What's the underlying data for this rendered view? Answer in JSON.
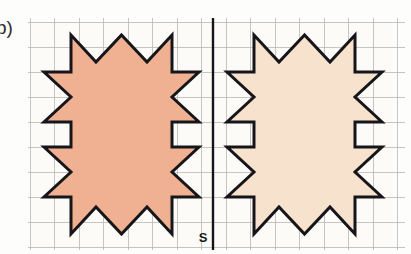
{
  "figure": {
    "exercise_label": "b)",
    "caption_axis_label": "S",
    "colors": {
      "background": "#fdfdfc",
      "grid_line": "#b9b7b4",
      "axis_line": "#16161a",
      "outline": "#16161a",
      "left_star_fill": "#f0b192",
      "right_star_fill": "#f7e2ce",
      "label_text": "#2b2b2b"
    }
  },
  "grid": {
    "origin_x": 30,
    "origin_y": 22,
    "cell_size": 25,
    "columns": 15,
    "rows": 9,
    "line_width": 0.8,
    "visible": true
  },
  "axis": {
    "name": "symmetry-axis",
    "label": "S",
    "orientation": "vertical",
    "x": 213,
    "y_top": 18,
    "y_bottom": 250,
    "label_x": 203,
    "label_y": 242
  },
  "shapes": [
    {
      "name": "left-star",
      "type": "eight-pointed-star",
      "fill": "#f0b192",
      "stroke": "#16161a",
      "stroke_width": 3.0,
      "center_x": 121.5,
      "center_y": 134.5,
      "points": "121.5,38 146,63 171,38 171,72.5 196,72.5 171,97 196,122 121.5,122 196,122 171,147 196,171.5 171,171.5 171,206 146,181 121.5,206 97,181 72,206 72,171.5 47,171.5 72,147 47,122 72,97 47,72.5 72,72.5 72,38 97,63",
      "vertices": [
        [
          121.5,
          38.0
        ],
        [
          146.0,
          63.0
        ],
        [
          171.0,
          38.0
        ],
        [
          171.0,
          72.5
        ],
        [
          196.0,
          72.5
        ],
        [
          171.0,
          97.0
        ],
        [
          196.0,
          122.0
        ],
        [
          171.0,
          122.0
        ],
        [
          171.0,
          147.0
        ],
        [
          196.0,
          147.0
        ],
        [
          171.0,
          171.5
        ],
        [
          196.0,
          196.0
        ],
        [
          171.0,
          196.0
        ],
        [
          171.0,
          206.0
        ],
        [
          146.0,
          181.0
        ],
        [
          121.5,
          206.0
        ],
        [
          97.0,
          181.0
        ],
        [
          72.0,
          206.0
        ],
        [
          72.0,
          171.5
        ],
        [
          47.0,
          171.5
        ],
        [
          72.0,
          147.0
        ],
        [
          47.0,
          122.0
        ],
        [
          72.0,
          97.0
        ],
        [
          47.0,
          72.5
        ],
        [
          72.0,
          72.5
        ],
        [
          72.0,
          38.0
        ],
        [
          97.0,
          63.0
        ]
      ]
    },
    {
      "name": "right-star",
      "type": "eight-pointed-star",
      "fill": "#f7e2ce",
      "stroke": "#16161a",
      "stroke_width": 3.0,
      "center_x": 304.5,
      "center_y": 134.5,
      "mirrored_from": "left-star",
      "mirror_axis_x": 213
    }
  ],
  "star_geometry": {
    "note": "Star path expressed in grid-cell units relative to its own centre; one unit = one grid square",
    "radius_long_u": 3.9,
    "radius_short_u": 1.0,
    "points_count": 8,
    "outer_u": [
      [
        0.0,
        -3.9
      ],
      [
        1.95,
        -1.95
      ],
      [
        3.9,
        0.0
      ],
      [
        1.95,
        1.95
      ],
      [
        0.0,
        3.9
      ],
      [
        -1.95,
        1.95
      ],
      [
        -3.9,
        0.0
      ],
      [
        -1.95,
        -1.95
      ]
    ],
    "inner_u": [
      [
        1.0,
        -2.0
      ],
      [
        2.0,
        -1.0
      ],
      [
        2.0,
        1.0
      ],
      [
        1.0,
        2.0
      ],
      [
        -1.0,
        2.0
      ],
      [
        -2.0,
        1.0
      ],
      [
        -2.0,
        -1.0
      ],
      [
        -1.0,
        -2.0
      ]
    ]
  },
  "legend": {
    "left_star_name": "original-figure",
    "right_star_name": "reflected-figure",
    "axis_name": "mirror-line-s"
  }
}
